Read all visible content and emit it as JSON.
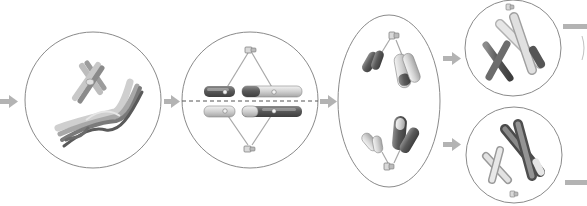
{
  "diagram": {
    "title": "",
    "colors": {
      "background": "#ffffff",
      "cell_outline": "#8a8a8a",
      "arrow": "#b0b0b0",
      "metaphase_plate": "#555555",
      "chromosome_dark": "#6a6a6a",
      "chromosome_mid": "#9a9a9a",
      "chromosome_light": "#d4d4d4",
      "spindle": "#a8a8a8"
    },
    "stages": [
      {
        "id": "stage-1",
        "name": "prophase-i-crossing-over",
        "shape": "circle",
        "cx": 93,
        "cy": 100,
        "r": 68
      },
      {
        "id": "stage-2",
        "name": "metaphase-i",
        "shape": "circle",
        "cx": 250,
        "cy": 100,
        "r": 68
      },
      {
        "id": "stage-3",
        "name": "anaphase-i",
        "shape": "ellipse",
        "cx": 389,
        "cy": 101,
        "rx": 51,
        "ry": 86
      },
      {
        "id": "stage-4a",
        "name": "daughter-cell-top",
        "shape": "circle",
        "cx": 513,
        "cy": 48,
        "r": 48
      },
      {
        "id": "stage-4b",
        "name": "daughter-cell-bottom",
        "shape": "circle",
        "cx": 514,
        "cy": 155,
        "r": 48
      }
    ],
    "arrows": [
      {
        "from": "incoming",
        "to": "stage-1"
      },
      {
        "from": "stage-1",
        "to": "stage-2"
      },
      {
        "from": "stage-2",
        "to": "stage-3"
      },
      {
        "from": "stage-3",
        "to": "stage-4a"
      },
      {
        "from": "stage-3",
        "to": "stage-4b"
      },
      {
        "from": "stage-4a",
        "to": "outgoing"
      },
      {
        "from": "stage-4b",
        "to": "outgoing"
      }
    ],
    "labels": []
  }
}
